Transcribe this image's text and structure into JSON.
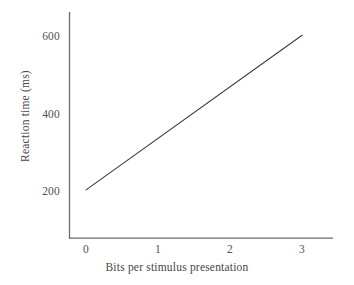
{
  "chart_data": {
    "type": "line",
    "title": "",
    "subtitle": "",
    "xlabel": "Bits per stimulus presentation",
    "ylabel": "Reaction time (ms)",
    "x": [
      0,
      3
    ],
    "series": [
      {
        "name": "Reaction time",
        "values": [
          205,
          605
        ],
        "color": "#3c3c3c"
      }
    ],
    "xlim": [
      -0.23,
      3.43
    ],
    "ylim": [
      80,
      665
    ],
    "xticks": [
      0,
      1,
      2,
      3
    ],
    "xtick_labels": [
      "0",
      "1",
      "2",
      "3"
    ],
    "yticks": [
      200,
      400,
      600
    ],
    "ytick_labels": [
      "200",
      "400",
      "600"
    ],
    "grid": false,
    "legend": "none",
    "annotations": [],
    "axis_color": "#6b6b6b",
    "background": "#ffffff"
  }
}
